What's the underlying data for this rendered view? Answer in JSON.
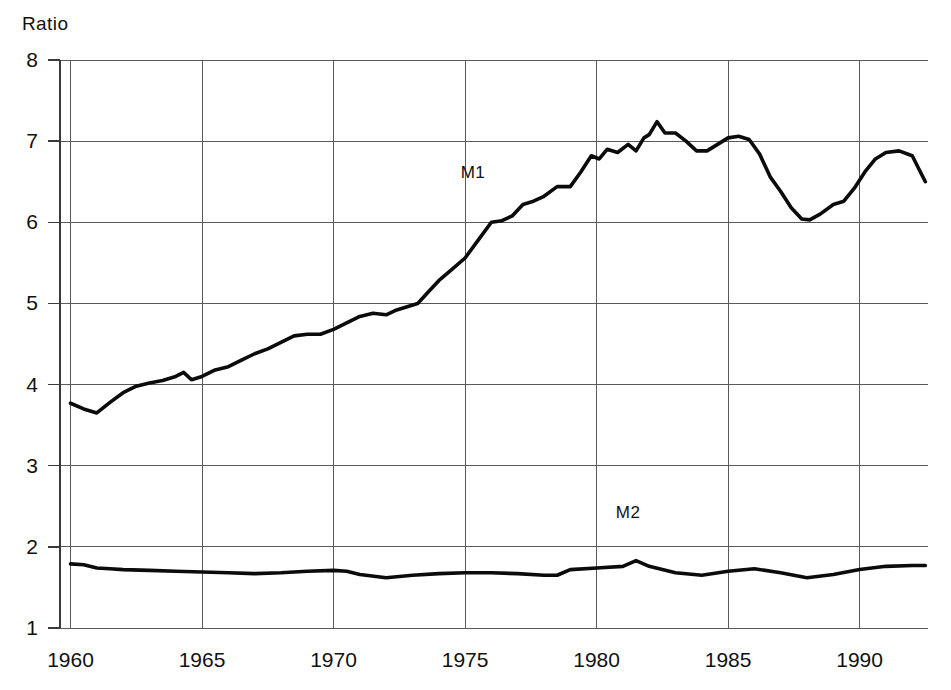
{
  "chart_data": {
    "type": "line",
    "title": "",
    "ylabel": "Ratio",
    "xlabel": "",
    "xlim": [
      1959.6,
      1992.6
    ],
    "ylim": [
      1,
      8
    ],
    "yticks": [
      1,
      2,
      3,
      4,
      5,
      6,
      7,
      8
    ],
    "xticks": [
      1960,
      1965,
      1970,
      1975,
      1980,
      1985,
      1990
    ],
    "ytick_labels": [
      "1",
      "2",
      "3",
      "4",
      "5",
      "6",
      "7",
      "8"
    ],
    "xtick_labels": [
      "1960",
      "1965",
      "1970",
      "1975",
      "1980",
      "1985",
      "1990"
    ],
    "grid": true,
    "legend_position": "inline-annotation",
    "annotations": [
      {
        "text": "M1",
        "x": 1975.3,
        "y": 6.55
      },
      {
        "text": "M2",
        "x": 1981.2,
        "y": 2.35
      }
    ],
    "series": [
      {
        "name": "M1",
        "x": [
          1960.0,
          1960.5,
          1961.0,
          1961.5,
          1962.0,
          1962.5,
          1963.0,
          1963.5,
          1964.0,
          1964.3,
          1964.6,
          1965.0,
          1965.5,
          1966.0,
          1966.5,
          1967.0,
          1967.5,
          1968.0,
          1968.5,
          1969.0,
          1969.5,
          1970.0,
          1970.5,
          1971.0,
          1971.5,
          1972.0,
          1972.4,
          1972.8,
          1973.2,
          1973.6,
          1974.0,
          1974.5,
          1975.0,
          1975.5,
          1976.0,
          1976.4,
          1976.8,
          1977.2,
          1977.6,
          1978.0,
          1978.5,
          1979.0,
          1979.4,
          1979.8,
          1980.1,
          1980.4,
          1980.8,
          1981.2,
          1981.5,
          1981.8,
          1982.0,
          1982.3,
          1982.6,
          1983.0,
          1983.4,
          1983.8,
          1984.2,
          1984.6,
          1985.0,
          1985.4,
          1985.8,
          1986.2,
          1986.6,
          1987.0,
          1987.4,
          1987.8,
          1988.1,
          1988.5,
          1989.0,
          1989.4,
          1989.8,
          1990.2,
          1990.6,
          1991.0,
          1991.5,
          1992.0,
          1992.5
        ],
        "y": [
          3.77,
          3.7,
          3.65,
          3.78,
          3.9,
          3.98,
          4.02,
          4.05,
          4.1,
          4.15,
          4.06,
          4.1,
          4.18,
          4.22,
          4.3,
          4.38,
          4.44,
          4.52,
          4.6,
          4.62,
          4.62,
          4.68,
          4.76,
          4.84,
          4.88,
          4.86,
          4.92,
          4.96,
          5.0,
          5.14,
          5.28,
          5.42,
          5.56,
          5.78,
          6.0,
          6.02,
          6.08,
          6.22,
          6.26,
          6.32,
          6.44,
          6.44,
          6.62,
          6.82,
          6.78,
          6.9,
          6.86,
          6.96,
          6.88,
          7.04,
          7.08,
          7.24,
          7.1,
          7.1,
          7.0,
          6.88,
          6.88,
          6.96,
          7.04,
          7.06,
          7.02,
          6.84,
          6.56,
          6.38,
          6.18,
          6.04,
          6.03,
          6.1,
          6.22,
          6.26,
          6.42,
          6.62,
          6.78,
          6.86,
          6.88,
          6.82,
          6.5
        ]
      },
      {
        "name": "M2",
        "x": [
          1960.0,
          1960.5,
          1961.0,
          1961.5,
          1962.0,
          1963.0,
          1964.0,
          1965.0,
          1966.0,
          1967.0,
          1968.0,
          1969.0,
          1970.0,
          1970.5,
          1971.0,
          1972.0,
          1973.0,
          1974.0,
          1975.0,
          1976.0,
          1977.0,
          1978.0,
          1978.5,
          1979.0,
          1980.0,
          1981.0,
          1981.5,
          1982.0,
          1983.0,
          1984.0,
          1985.0,
          1986.0,
          1987.0,
          1988.0,
          1989.0,
          1990.0,
          1991.0,
          1992.0,
          1992.5
        ],
        "y": [
          1.79,
          1.78,
          1.74,
          1.73,
          1.72,
          1.71,
          1.7,
          1.69,
          1.68,
          1.67,
          1.68,
          1.7,
          1.71,
          1.7,
          1.66,
          1.62,
          1.65,
          1.67,
          1.68,
          1.68,
          1.67,
          1.65,
          1.65,
          1.72,
          1.74,
          1.76,
          1.83,
          1.76,
          1.68,
          1.65,
          1.7,
          1.73,
          1.68,
          1.62,
          1.66,
          1.72,
          1.76,
          1.77,
          1.77
        ]
      }
    ]
  },
  "axes": {
    "y_title": "Ratio"
  }
}
